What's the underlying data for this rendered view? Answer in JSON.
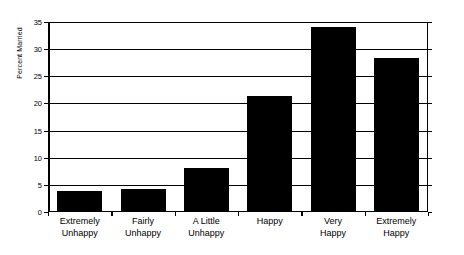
{
  "chart_data": {
    "type": "bar",
    "title": "",
    "xlabel": "",
    "ylabel": "Percent Married",
    "categories": [
      "Extremely Unhappy",
      "Fairly Unhappy",
      "A Little Unhappy",
      "Happy",
      "Very Happy",
      "Extremely Happy"
    ],
    "category_lines": [
      [
        "Extremely",
        "Unhappy"
      ],
      [
        "Fairly",
        "Unhappy"
      ],
      [
        "A Little",
        "Unhappy"
      ],
      [
        "Happy",
        ""
      ],
      [
        "Very",
        "Happy"
      ],
      [
        "Extremely",
        "Happy"
      ]
    ],
    "values": [
      3.8,
      4.3,
      8.1,
      21.4,
      34.1,
      28.4
    ],
    "ylim": [
      0,
      35
    ],
    "ytick_values": [
      0,
      5,
      10,
      15,
      20,
      25,
      30,
      35
    ],
    "ytick_labels": [
      "0",
      "5",
      "10",
      "15",
      "20",
      "25",
      "30",
      "35"
    ],
    "grid": true,
    "legend": "none",
    "bar_color": "#000000",
    "axis_color": "#000000",
    "background_color": "#ffffff"
  }
}
